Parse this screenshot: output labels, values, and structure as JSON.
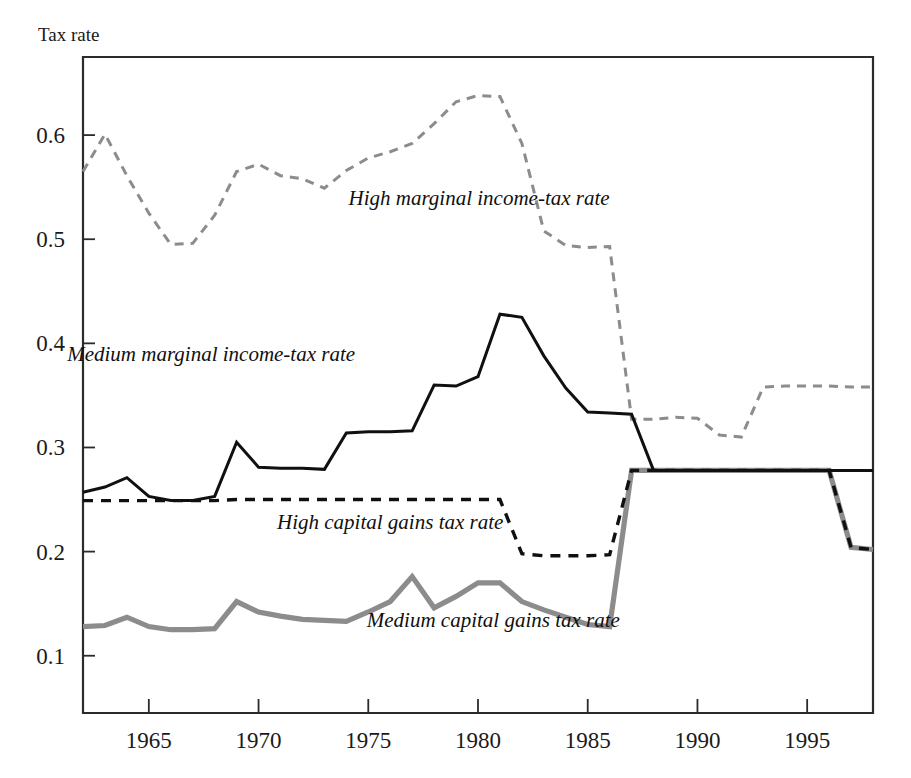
{
  "chart_data": {
    "type": "line",
    "title": "",
    "ylabel": "Tax rate",
    "xlabel": "",
    "xlim": [
      1962,
      1998
    ],
    "ylim": [
      0.045,
      0.675
    ],
    "grid": false,
    "legend_position": "inline-annotations",
    "x_ticks": [
      1965,
      1970,
      1975,
      1980,
      1985,
      1990,
      1995
    ],
    "x_tick_labels": [
      "1965",
      "1970",
      "1975",
      "1980",
      "1985",
      "1990",
      "1995"
    ],
    "y_ticks": [
      0.1,
      0.2,
      0.3,
      0.4,
      0.5,
      0.6
    ],
    "y_tick_labels": [
      "0.1",
      "0.2",
      "0.3",
      "0.4",
      "0.5",
      "0.6"
    ],
    "x": [
      1962,
      1963,
      1964,
      1965,
      1966,
      1967,
      1968,
      1969,
      1970,
      1971,
      1972,
      1973,
      1974,
      1975,
      1976,
      1977,
      1978,
      1979,
      1980,
      1981,
      1982,
      1983,
      1984,
      1985,
      1986,
      1987,
      1988,
      1989,
      1990,
      1991,
      1992,
      1993,
      1994,
      1995,
      1996,
      1997,
      1998
    ],
    "series": [
      {
        "name": "High marginal income-tax rate",
        "key": "high_marginal",
        "color": "#8c8c8c",
        "style": "dashed",
        "width": 3.0,
        "dash": "9,7",
        "label_x": 1986.0,
        "label_y": 0.533,
        "label_anchor": "end",
        "values": [
          0.565,
          0.601,
          0.561,
          0.525,
          0.495,
          0.496,
          0.523,
          0.565,
          0.572,
          0.561,
          0.558,
          0.549,
          0.566,
          0.578,
          0.584,
          0.592,
          0.611,
          0.632,
          0.638,
          0.637,
          0.592,
          0.508,
          0.494,
          0.492,
          0.493,
          0.327,
          0.327,
          0.329,
          0.328,
          0.312,
          0.31,
          0.358,
          0.359,
          0.359,
          0.359,
          0.358,
          0.358
        ]
      },
      {
        "name": "Medium marginal income-tax rate",
        "key": "medium_marginal",
        "color": "#101010",
        "style": "solid",
        "width": 3.0,
        "dash": "",
        "label_x": 1974.4,
        "label_y": 0.383,
        "label_anchor": "end",
        "values": [
          0.257,
          0.262,
          0.271,
          0.253,
          0.249,
          0.249,
          0.253,
          0.305,
          0.281,
          0.28,
          0.28,
          0.279,
          0.314,
          0.315,
          0.315,
          0.316,
          0.36,
          0.359,
          0.368,
          0.428,
          0.425,
          0.388,
          0.357,
          0.334,
          0.333,
          0.332,
          0.278,
          0.278,
          0.278,
          0.278,
          0.278,
          0.278,
          0.278,
          0.278,
          0.278,
          0.278,
          0.278
        ]
      },
      {
        "name": "High capital gains tax rate",
        "key": "high_capgains",
        "color": "#101010",
        "style": "dashed",
        "width": 3.4,
        "dash": "10,8",
        "label_x": 1976.0,
        "label_y": 0.222,
        "label_anchor": "middle",
        "values": [
          0.249,
          0.249,
          0.249,
          0.249,
          0.249,
          0.249,
          0.249,
          0.25,
          0.25,
          0.25,
          0.25,
          0.25,
          0.25,
          0.25,
          0.25,
          0.25,
          0.25,
          0.25,
          0.25,
          0.25,
          0.198,
          0.196,
          0.196,
          0.196,
          0.197,
          0.278,
          0.278,
          0.278,
          0.278,
          0.278,
          0.278,
          0.278,
          0.278,
          0.278,
          0.278,
          0.204,
          0.202
        ]
      },
      {
        "name": "Medium capital gains tax rate",
        "key": "medium_capgains",
        "color": "#8c8c8c",
        "style": "solid",
        "width": 5.2,
        "dash": "",
        "label_x": 1980.7,
        "label_y": 0.128,
        "label_anchor": "middle",
        "values": [
          0.128,
          0.129,
          0.137,
          0.128,
          0.125,
          0.125,
          0.126,
          0.152,
          0.142,
          0.138,
          0.135,
          0.134,
          0.133,
          0.142,
          0.152,
          0.176,
          0.146,
          0.157,
          0.17,
          0.17,
          0.152,
          0.144,
          0.137,
          0.13,
          0.128,
          0.278,
          0.278,
          0.278,
          0.278,
          0.278,
          0.278,
          0.278,
          0.278,
          0.278,
          0.278,
          0.204,
          0.202
        ]
      }
    ]
  },
  "plot_geometry": {
    "left": 83,
    "right": 873,
    "top": 57,
    "bottom": 713
  },
  "axis_title_position": {
    "x": 38,
    "y": 41
  }
}
